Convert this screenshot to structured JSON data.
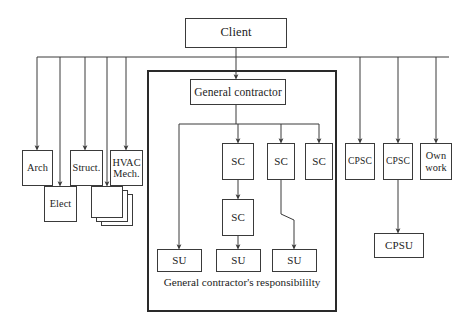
{
  "diagram": {
    "canvas": {
      "width": 464,
      "height": 330
    },
    "colors": {
      "line": "#3a3a3a",
      "region_border": "#2a2a2a",
      "text": "#1c1c1c",
      "background": "#ffffff"
    },
    "region": {
      "caption": "General contractor's responsibililty",
      "x": 147,
      "y": 70,
      "width": 190,
      "height": 242
    },
    "nodes": [
      {
        "id": "client",
        "label": "Client",
        "x": 185,
        "y": 18,
        "width": 102,
        "height": 30
      },
      {
        "id": "gc",
        "label": "General contractor",
        "x": 190,
        "y": 79,
        "width": 96,
        "height": 26
      },
      {
        "id": "arch",
        "label": "Arch",
        "x": 22,
        "y": 150,
        "width": 31,
        "height": 36
      },
      {
        "id": "elect",
        "label": "Elect",
        "x": 44,
        "y": 186,
        "width": 33,
        "height": 36
      },
      {
        "id": "struct",
        "label": "Struct.",
        "x": 70,
        "y": 150,
        "width": 33,
        "height": 36
      },
      {
        "id": "hvac",
        "label": "HVAC Mech.",
        "x": 110,
        "y": 150,
        "width": 33,
        "height": 36
      },
      {
        "id": "stack3",
        "label": "",
        "x": 101,
        "y": 194,
        "width": 32,
        "height": 32
      },
      {
        "id": "stack2",
        "label": "",
        "x": 96,
        "y": 190,
        "width": 32,
        "height": 32
      },
      {
        "id": "stack1",
        "label": "",
        "x": 91,
        "y": 186,
        "width": 32,
        "height": 32
      },
      {
        "id": "sc1",
        "label": "SC",
        "x": 222,
        "y": 143,
        "width": 32,
        "height": 37
      },
      {
        "id": "sc2",
        "label": "SC",
        "x": 267,
        "y": 143,
        "width": 28,
        "height": 37
      },
      {
        "id": "sc3",
        "label": "SC",
        "x": 305,
        "y": 143,
        "width": 28,
        "height": 37
      },
      {
        "id": "sc1b",
        "label": "SC",
        "x": 222,
        "y": 199,
        "width": 32,
        "height": 37
      },
      {
        "id": "su1",
        "label": "SU",
        "x": 157,
        "y": 249,
        "width": 45,
        "height": 23
      },
      {
        "id": "su2",
        "label": "SU",
        "x": 216,
        "y": 249,
        "width": 45,
        "height": 23
      },
      {
        "id": "su3",
        "label": "SU",
        "x": 272,
        "y": 249,
        "width": 45,
        "height": 23
      },
      {
        "id": "cpsc1",
        "label": "CPSC",
        "x": 345,
        "y": 143,
        "width": 30,
        "height": 37
      },
      {
        "id": "cpsc2",
        "label": "CPSC",
        "x": 383,
        "y": 143,
        "width": 30,
        "height": 37
      },
      {
        "id": "ownwork",
        "label": "Own work",
        "x": 420,
        "y": 143,
        "width": 32,
        "height": 37
      },
      {
        "id": "cpsu",
        "label": "CPSU",
        "x": 374,
        "y": 233,
        "width": 50,
        "height": 25
      }
    ],
    "edges": [
      {
        "from": "client",
        "to": "bus",
        "kind": "vertical"
      },
      {
        "from": "bus",
        "to": "gc",
        "kind": "vertical-arrow"
      },
      {
        "from": "bus",
        "to": "arch",
        "kind": "drop-arrow"
      },
      {
        "from": "bus",
        "to": "elect",
        "kind": "drop-arrow"
      },
      {
        "from": "bus",
        "to": "struct",
        "kind": "drop-arrow"
      },
      {
        "from": "bus",
        "to": "stack1",
        "kind": "drop-arrow"
      },
      {
        "from": "bus",
        "to": "hvac",
        "kind": "drop-arrow"
      },
      {
        "from": "bus",
        "to": "cpsc1",
        "kind": "drop-arrow"
      },
      {
        "from": "bus",
        "to": "cpsc2",
        "kind": "drop-arrow"
      },
      {
        "from": "bus",
        "to": "ownwork",
        "kind": "drop-arrow"
      },
      {
        "from": "gc",
        "to": "sc1",
        "kind": "tree-arrow"
      },
      {
        "from": "gc",
        "to": "sc2",
        "kind": "tree-arrow"
      },
      {
        "from": "gc",
        "to": "sc3",
        "kind": "tree-arrow"
      },
      {
        "from": "gc",
        "to": "su1",
        "kind": "tree-arrow"
      },
      {
        "from": "sc1",
        "to": "sc1b",
        "kind": "vertical-arrow"
      },
      {
        "from": "sc1b",
        "to": "su2",
        "kind": "vertical-arrow"
      },
      {
        "from": "sc2",
        "to": "su3",
        "kind": "jog-arrow"
      },
      {
        "from": "cpsc2",
        "to": "cpsu",
        "kind": "vertical-arrow"
      }
    ]
  }
}
